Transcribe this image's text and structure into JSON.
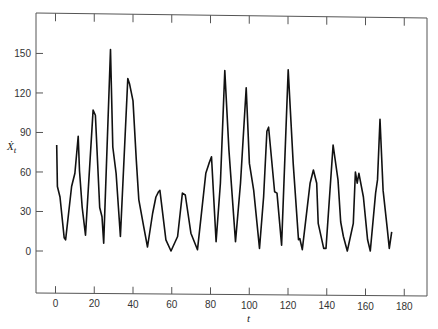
{
  "chart_data": {
    "type": "line",
    "title": "",
    "xlabel": "t",
    "ylabel": "Ẋ",
    "ylabel_subscript": "t",
    "xlim": [
      -10,
      190
    ],
    "ylim": [
      -30,
      180
    ],
    "x_ticks": [
      0,
      20,
      40,
      60,
      80,
      100,
      120,
      140,
      160,
      180
    ],
    "y_ticks": [
      0,
      30,
      60,
      90,
      120,
      150
    ],
    "grid": false,
    "legend": null,
    "line_color": "#111111",
    "series": [
      {
        "name": "X_t",
        "x": [
          0.6,
          1,
          2.3,
          4.5,
          5.2,
          8.3,
          10,
          11.7,
          12.4,
          13.8,
          15.5,
          19.4,
          20.6,
          22.8,
          24,
          24.9,
          28.4,
          29.6,
          31.3,
          33.5,
          37.3,
          38.2,
          40,
          41.7,
          43,
          45.5,
          47.5,
          50.1,
          51.8,
          53.2,
          53.9,
          57,
          59.6,
          63,
          65.5,
          67,
          69.9,
          73.3,
          77.6,
          79.2,
          80.5,
          82.9,
          85.1,
          87.4,
          89.5,
          92.9,
          95.5,
          98.4,
          100.1,
          102.3,
          105.3,
          107.4,
          109.1,
          110,
          113.1,
          114.3,
          116.7,
          120.1,
          122.7,
          125.4,
          126.1,
          127.4,
          131.4,
          133.1,
          134.8,
          135.6,
          138.4,
          139.6,
          143.3,
          145.8,
          147.2,
          148.6,
          150.6,
          153.7,
          154.8,
          155.7,
          156.6,
          158.9,
          161.1,
          162.5,
          165.2,
          166.2,
          167.5,
          169.1,
          171.3,
          172.3,
          173.5
        ],
        "values": [
          80.5,
          49,
          41,
          10,
          8.5,
          49,
          59,
          87,
          61,
          33,
          12,
          107,
          103,
          33,
          26,
          6,
          153,
          79,
          59,
          11,
          131,
          127,
          114,
          69,
          39,
          18.5,
          3,
          28.5,
          41,
          45,
          46,
          8.5,
          0,
          11,
          44,
          42.5,
          13.5,
          1,
          59,
          66.5,
          71.5,
          7,
          51.5,
          137,
          77,
          7,
          51.5,
          124,
          66.5,
          46,
          2,
          41,
          91,
          94,
          45,
          44,
          4.5,
          137.5,
          66.5,
          8.5,
          9.5,
          1,
          51.5,
          61.5,
          51.5,
          21,
          2,
          2,
          80.5,
          54,
          22,
          11,
          0,
          21,
          60,
          51.5,
          59,
          41,
          8.5,
          0,
          44,
          54,
          100,
          46,
          16,
          2,
          14.5
        ]
      }
    ]
  },
  "axes": {
    "x_tick_labels": [
      "0",
      "20",
      "40",
      "60",
      "80",
      "100",
      "120",
      "140",
      "160",
      "180"
    ],
    "y_tick_labels": [
      "0",
      "30",
      "60",
      "90",
      "120",
      "150"
    ],
    "xlabel": "t",
    "ylabel_main": "Ẋ",
    "ylabel_sub": "t"
  }
}
